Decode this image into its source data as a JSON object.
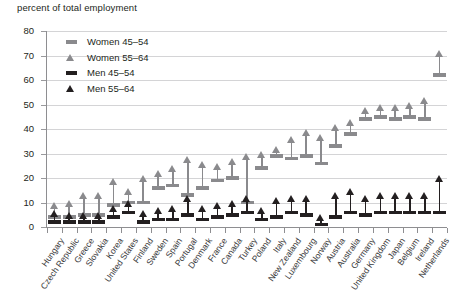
{
  "chart_data": {
    "type": "scatter",
    "title": "percent of total employment",
    "xlabel": "",
    "ylabel": "percent of total employment",
    "ylim": [
      0,
      80
    ],
    "yticks": [
      0,
      10,
      20,
      30,
      40,
      50,
      60,
      70,
      80
    ],
    "grid": true,
    "legend_position": "top-left",
    "categories": [
      "Hungary",
      "Czech Republic",
      "Greece",
      "Slovakia",
      "Korea",
      "United States",
      "Finland",
      "Sweden",
      "Spain",
      "Portugal",
      "Denmark",
      "France",
      "Canada",
      "Turkey",
      "Poland",
      "Italy",
      "New Zealand",
      "Luxembourg",
      "Norway",
      "Austria",
      "Australia",
      "Germany",
      "United Kingdom",
      "Japan",
      "Belgium",
      "Ireland",
      "Netherlands"
    ],
    "series": [
      {
        "name": "Women 45-54",
        "marker": "bar",
        "color": "#8a8a8d",
        "values": [
          4,
          4,
          5,
          5,
          9,
          10,
          10,
          16,
          17,
          13,
          16,
          19,
          20,
          10,
          24,
          29,
          28,
          29,
          26,
          33,
          38,
          44,
          45,
          44,
          45,
          44,
          62
        ]
      },
      {
        "name": "Women 55-64",
        "marker": "triangle",
        "color": "#8a8a8d",
        "values": [
          8,
          9,
          12,
          12,
          18,
          14,
          19,
          21,
          23,
          27,
          25,
          24,
          26,
          28,
          29,
          31,
          35,
          38,
          36,
          40,
          42,
          47,
          48,
          48,
          49,
          51,
          70
        ]
      },
      {
        "name": "Men 45-54",
        "marker": "bar",
        "color": "#231f20",
        "values": [
          2,
          2,
          2,
          2,
          4,
          6,
          2,
          3,
          3,
          5,
          3,
          4,
          5,
          6,
          3,
          4,
          6,
          5,
          1,
          4,
          6,
          5,
          6,
          6,
          6,
          6,
          6
        ]
      },
      {
        "name": "Men 55-64",
        "marker": "triangle",
        "color": "#231f20",
        "values": [
          5,
          4,
          4,
          4,
          7,
          9,
          5,
          6,
          7,
          11,
          7,
          8,
          9,
          11,
          6,
          10,
          11,
          11,
          3,
          12,
          14,
          11,
          12,
          12,
          12,
          12,
          19
        ]
      }
    ]
  },
  "legend": {
    "items": [
      {
        "label": "Women 45–54",
        "key": "bar",
        "color": "#8a8a8d"
      },
      {
        "label": "Women 55–64",
        "key": "triangle",
        "color": "#8a8a8d"
      },
      {
        "label": "Men 45–54",
        "key": "bar",
        "color": "#231f20"
      },
      {
        "label": "Men 55–64",
        "key": "triangle",
        "color": "#231f20"
      }
    ]
  }
}
